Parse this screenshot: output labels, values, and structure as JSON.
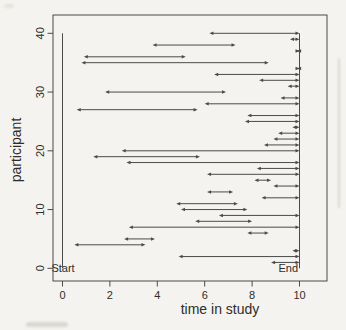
{
  "page": {
    "background": "#f5f3ef"
  },
  "chart_data": {
    "type": "scatter",
    "subtype": "participant-followup-segments",
    "title": "",
    "xlabel": "time in study",
    "ylabel": "participant",
    "xlim": [
      0,
      10
    ],
    "ylim": [
      0,
      40
    ],
    "x_ticks": [
      0,
      2,
      4,
      6,
      8,
      10
    ],
    "y_ticks": [
      0,
      10,
      20,
      30,
      40
    ],
    "grid": false,
    "legend_position": "none",
    "frame_box": true,
    "marker_style": "arrowheads-both-ends",
    "annotations": [
      {
        "text": "Start",
        "x": 0,
        "y": 0
      },
      {
        "text": "End",
        "x": 10,
        "y": 0
      }
    ],
    "reference_lines": [
      {
        "axis": "x",
        "value": 0,
        "label": "Start"
      },
      {
        "axis": "x",
        "value": 10,
        "label": "End"
      }
    ],
    "colors": {
      "line": "#4b4b4b",
      "frame": "#4b4b4b",
      "text": "#2e2d2b",
      "background": "#f5f3ef"
    },
    "segments": [
      {
        "participant": 1,
        "start": 8.8,
        "end": 10
      },
      {
        "participant": 2,
        "start": 4.9,
        "end": 10
      },
      {
        "participant": 3,
        "start": 9.7,
        "end": 10
      },
      {
        "participant": 4,
        "start": 0.5,
        "end": 3.5
      },
      {
        "participant": 5,
        "start": 2.6,
        "end": 3.9
      },
      {
        "participant": 6,
        "start": 7.8,
        "end": 8.7
      },
      {
        "participant": 7,
        "start": 2.8,
        "end": 10
      },
      {
        "participant": 8,
        "start": 5.6,
        "end": 8.0
      },
      {
        "participant": 9,
        "start": 6.6,
        "end": 10
      },
      {
        "participant": 10,
        "start": 5.0,
        "end": 7.8
      },
      {
        "participant": 11,
        "start": 4.8,
        "end": 7.4
      },
      {
        "participant": 12,
        "start": 8.4,
        "end": 10
      },
      {
        "participant": 13,
        "start": 6.1,
        "end": 7.2
      },
      {
        "participant": 14,
        "start": 8.9,
        "end": 10
      },
      {
        "participant": 15,
        "start": 8.1,
        "end": 8.8
      },
      {
        "participant": 16,
        "start": 6.1,
        "end": 10
      },
      {
        "participant": 17,
        "start": 8.2,
        "end": 10
      },
      {
        "participant": 18,
        "start": 2.7,
        "end": 10
      },
      {
        "participant": 19,
        "start": 1.3,
        "end": 5.8
      },
      {
        "participant": 20,
        "start": 2.5,
        "end": 10
      },
      {
        "participant": 21,
        "start": 8.5,
        "end": 10
      },
      {
        "participant": 22,
        "start": 8.9,
        "end": 10
      },
      {
        "participant": 23,
        "start": 9.1,
        "end": 10
      },
      {
        "participant": 24,
        "start": 9.7,
        "end": 10
      },
      {
        "participant": 25,
        "start": 7.7,
        "end": 10
      },
      {
        "participant": 26,
        "start": 7.8,
        "end": 10
      },
      {
        "participant": 27,
        "start": 0.6,
        "end": 5.7
      },
      {
        "participant": 28,
        "start": 6.0,
        "end": 10
      },
      {
        "participant": 29,
        "start": 9.2,
        "end": 10
      },
      {
        "participant": 30,
        "start": 1.8,
        "end": 6.9
      },
      {
        "participant": 31,
        "start": 9.5,
        "end": 10
      },
      {
        "participant": 32,
        "start": 8.3,
        "end": 10
      },
      {
        "participant": 33,
        "start": 6.4,
        "end": 10
      },
      {
        "participant": 34,
        "start": 9.9,
        "end": 10
      },
      {
        "participant": 35,
        "start": 0.8,
        "end": 8.7
      },
      {
        "participant": 36,
        "start": 0.9,
        "end": 5.2
      },
      {
        "participant": 37,
        "start": 9.9,
        "end": 10
      },
      {
        "participant": 38,
        "start": 3.8,
        "end": 7.3
      },
      {
        "participant": 39,
        "start": 9.6,
        "end": 10
      },
      {
        "participant": 40,
        "start": 6.2,
        "end": 10
      }
    ]
  }
}
